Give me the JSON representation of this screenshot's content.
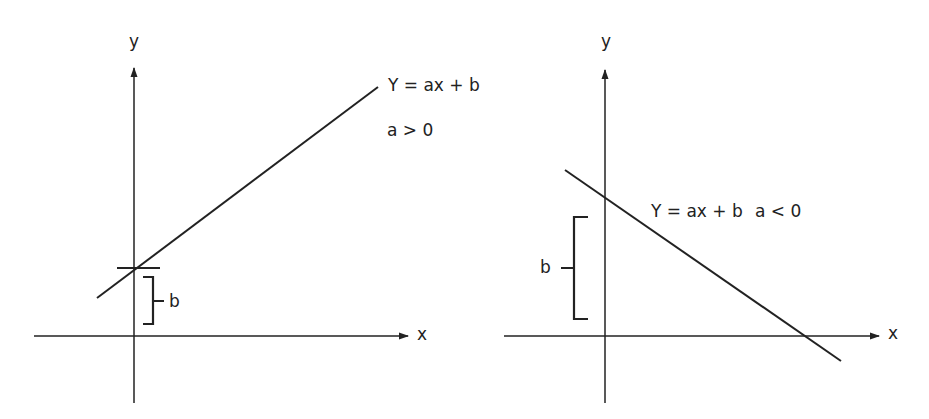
{
  "figure": {
    "stroke_color": "#222222",
    "background": "#ffffff"
  },
  "panels": [
    {
      "id": "positive-slope",
      "axis_labels": {
        "x": "x",
        "y": "y"
      },
      "equation": "Y = ax + b",
      "condition": "a > 0",
      "intercept_label": "b",
      "geometry": {
        "x_axis": {
          "x1": 34,
          "y": 336,
          "x2": 408
        },
        "y_axis": {
          "x": 134,
          "y1": 403,
          "y2": 68
        },
        "line": {
          "x1": 97,
          "y1": 298,
          "x2": 378,
          "y2": 87
        },
        "intercept_tick": {
          "x1": 117,
          "x2": 160,
          "y": 268
        },
        "bracket": {
          "x": 153,
          "top": 277,
          "bottom": 324,
          "mid": 301,
          "arm_left": 143,
          "tip_right": 164
        },
        "label_positions": {
          "y_label": [
            129,
            33
          ],
          "x_label": [
            417,
            326
          ],
          "equation": [
            388,
            77
          ],
          "condition": [
            387,
            122
          ],
          "b_label": [
            168,
            293
          ]
        }
      }
    },
    {
      "id": "negative-slope",
      "axis_labels": {
        "x": "x",
        "y": "y"
      },
      "equation": "Y = ax + b",
      "condition": "a < 0",
      "intercept_label": "b",
      "geometry": {
        "x_axis": {
          "x1": 504,
          "y": 336,
          "x2": 879
        },
        "y_axis": {
          "x": 605,
          "y1": 403,
          "y2": 70
        },
        "line": {
          "x1": 565,
          "y1": 170,
          "x2": 841,
          "y2": 361
        },
        "bracket": {
          "x": 574,
          "top": 217,
          "bottom": 319,
          "mid": 268,
          "arm_right": 588,
          "tip_left": 561
        },
        "label_positions": {
          "y_label": [
            601,
            33
          ],
          "x_label": [
            888,
            325
          ],
          "equation": [
            651,
            203
          ],
          "condition": [
            753,
            203
          ],
          "b_label": [
            540,
            259
          ]
        }
      }
    }
  ]
}
